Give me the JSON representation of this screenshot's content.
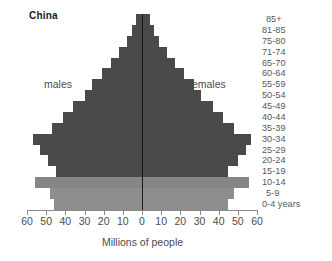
{
  "chart_data": {
    "type": "bar",
    "subtype": "population-pyramid",
    "title": "China",
    "xlabel": "Millions of people",
    "ylabel": "",
    "xlim": [
      -60,
      60
    ],
    "xticks": [
      60,
      50,
      40,
      30,
      20,
      10,
      0,
      10,
      20,
      30,
      40,
      50,
      60
    ],
    "grid": false,
    "legend_position": "in-plot",
    "units": "millions",
    "categories": [
      "85+",
      "81-85",
      "75-80",
      "71-74",
      "65-70",
      "60-64",
      "55-59",
      "50-54",
      "45-49",
      "40-44",
      "35-39",
      "30-34",
      "25-29",
      "20-24",
      "15-19",
      "10-14",
      "5-9",
      "0-4 years"
    ],
    "series": [
      {
        "name": "males",
        "side": "left",
        "color": "#4a4a4a",
        "values": [
          3,
          5,
          8,
          12,
          16,
          21,
          26,
          30,
          36,
          41,
          47,
          57,
          53,
          49,
          45,
          56,
          48,
          46
        ]
      },
      {
        "name": "females",
        "side": "right",
        "color": "#4a4a4a",
        "values": [
          4,
          6,
          9,
          13,
          17,
          22,
          27,
          31,
          37,
          42,
          48,
          57,
          54,
          50,
          45,
          56,
          48,
          45
        ]
      }
    ],
    "bar_colors": [
      "#4a4a4a",
      "#4a4a4a",
      "#4a4a4a",
      "#4a4a4a",
      "#4a4a4a",
      "#4a4a4a",
      "#4a4a4a",
      "#4a4a4a",
      "#4a4a4a",
      "#4a4a4a",
      "#4a4a4a",
      "#4a4a4a",
      "#4a4a4a",
      "#4a4a4a",
      "#4a4a4a",
      "#868686",
      "#8e8e8e",
      "#8e8e8e"
    ],
    "annotations": [
      {
        "text": "males",
        "position": "left-upper"
      },
      {
        "text": "females",
        "position": "right-upper"
      }
    ]
  },
  "colors": {
    "bar_dark": "#4a4a4a",
    "bar_light": "#8e8e8e",
    "axis": "#8c8c8c",
    "zero_line": "#1a1a1a",
    "text": "#4d4d4d",
    "title_text": "#1a1a1a",
    "background": "#ffffff"
  }
}
